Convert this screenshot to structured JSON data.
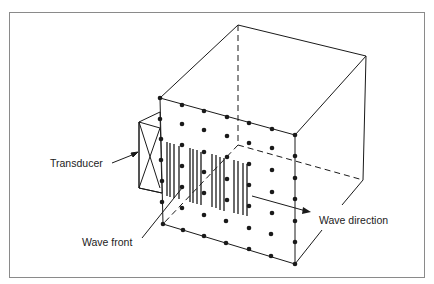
{
  "diagram": {
    "labels": {
      "transducer": "Transducer",
      "wave_front": "Wave front",
      "wave_direction": "Wave direction"
    },
    "colors": {
      "stroke": "#1a1a1a",
      "frame": "#8a8a8a",
      "background": "#ffffff"
    },
    "components": [
      {
        "name": "cube",
        "description": "Material block drawn in isometric view with hidden edges dashed"
      },
      {
        "name": "particle-grid",
        "description": "Grid of dots on front face representing material particles"
      },
      {
        "name": "transducer",
        "description": "Box with X on the left face emitting waves"
      },
      {
        "name": "wave-front",
        "description": "Groups of vertical bars showing compressed wave fronts"
      },
      {
        "name": "wave-direction-arrow",
        "description": "Arrow pointing right indicating propagation direction"
      }
    ]
  }
}
